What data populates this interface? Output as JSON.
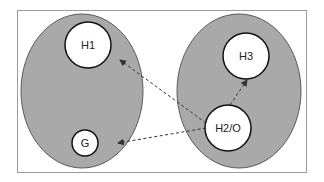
{
  "diagram": {
    "colors": {
      "background": "#ffffff",
      "frame_stroke": "#9a9a9a",
      "region_fill": "#a9a9a9",
      "region_stroke": "#5a5a5a",
      "node_fill": "#ffffff",
      "node_stroke": "#111111",
      "arrow_stroke": "#333333"
    },
    "regions": [
      {
        "id": "left-region",
        "label": ""
      },
      {
        "id": "right-region",
        "label": ""
      }
    ],
    "nodes": [
      {
        "id": "H1",
        "label": "H1",
        "region": "left-region"
      },
      {
        "id": "G",
        "label": "G",
        "region": "left-region"
      },
      {
        "id": "H3",
        "label": "H3",
        "region": "right-region"
      },
      {
        "id": "H2O",
        "label": "H2/O",
        "region": "right-region"
      }
    ],
    "edges": [
      {
        "from": "H2/O",
        "to": "H1",
        "style": "dashed",
        "arrow": "end"
      },
      {
        "from": "H2/O",
        "to": "G",
        "style": "dashed",
        "arrow": "end"
      },
      {
        "from": "H2/O",
        "to": "H3",
        "style": "dashed",
        "arrow": "end"
      }
    ]
  }
}
